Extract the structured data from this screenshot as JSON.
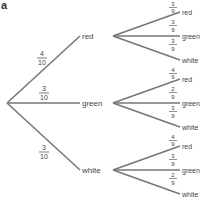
{
  "title": "a",
  "colors": {
    "line": "#777777",
    "text": "#444444"
  },
  "level1": [
    {
      "outcome": "red",
      "num": "4",
      "den": "10"
    },
    {
      "outcome": "green",
      "num": "3",
      "den": "10"
    },
    {
      "outcome": "white",
      "num": "3",
      "den": "10"
    }
  ],
  "level2": {
    "red": [
      {
        "outcome": "red",
        "num": "3",
        "den": "9"
      },
      {
        "outcome": "green",
        "num": "3",
        "den": "9"
      },
      {
        "outcome": "white",
        "num": "3",
        "den": "9"
      }
    ],
    "green": [
      {
        "outcome": "red",
        "num": "4",
        "den": "9"
      },
      {
        "outcome": "green",
        "num": "2",
        "den": "9"
      },
      {
        "outcome": "white",
        "num": "3",
        "den": "9"
      }
    ],
    "white": [
      {
        "outcome": "red",
        "num": "4",
        "den": "9"
      },
      {
        "outcome": "green",
        "num": "3",
        "den": "9"
      },
      {
        "outcome": "white",
        "num": "2",
        "den": "9"
      }
    ]
  }
}
